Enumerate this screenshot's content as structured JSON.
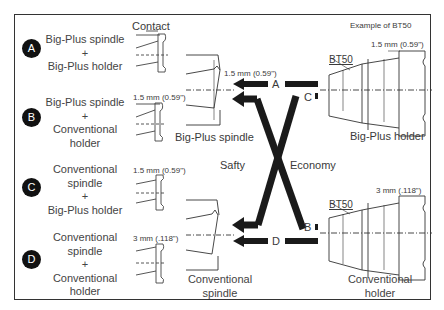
{
  "header": {
    "contact_label": "Contact",
    "example_label": "Example of BT50"
  },
  "combinations": [
    {
      "badge": "A",
      "line1": "Big-Plus spindle",
      "line2": "+",
      "line3": "Big-Plus holder",
      "line4": "",
      "contact_gap": ""
    },
    {
      "badge": "B",
      "line1": "Big-Plus spindle",
      "line2": "+",
      "line3": "Conventional",
      "line4": "holder",
      "contact_gap": "1.5 mm (0.59\")"
    },
    {
      "badge": "C",
      "line1": "Conventional",
      "line2": "spindle",
      "line3": "+",
      "line4": "Big-Plus holder",
      "contact_gap": "1.5 mm (0.59\")"
    },
    {
      "badge": "D",
      "line1": "Conventional",
      "line2": "spindle",
      "line3": "+",
      "line4": "Conventional",
      "line5": "holder",
      "contact_gap": "3 mm (.118\")"
    }
  ],
  "spindles": {
    "bigplus": {
      "label": "Big-Plus spindle",
      "gap": "1.5 mm (0.59\")",
      "dia": "Ø69.85 mm",
      "dia_in": "(2.750\")"
    },
    "conventional": {
      "label1": "Conventional",
      "label2": "spindle",
      "dia": "Ø69.85 mm",
      "dia_in": "(2.750\")"
    }
  },
  "holders": {
    "bigplus": {
      "label": "Big-Plus holder",
      "taper": "BT50",
      "gap": "1.5 mm (0.59\")",
      "dia1": "Ø100 mm",
      "dia1_in": "(3.937\")",
      "dia2": "Ø69.85 mm",
      "dia2_in": "(2.750\")"
    },
    "conventional": {
      "label1": "Conventional",
      "label2": "holder",
      "taper": "BT50",
      "gap": "3 mm (.118\")",
      "dia1": "Ø100 mm",
      "dia1_in": "(3.937\")",
      "dia2": "Ø69.85 mm",
      "dia2_in": "(2.750\")"
    }
  },
  "arrows": {
    "a": "A",
    "b": "B",
    "c": "C",
    "d": "D",
    "left_label": "Safty",
    "right_label": "Economy"
  }
}
